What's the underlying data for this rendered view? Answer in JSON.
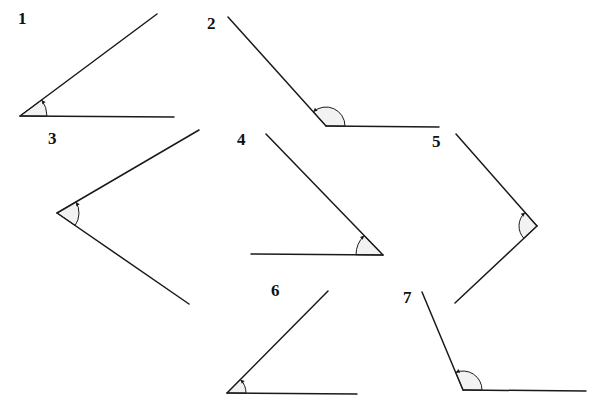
{
  "diagram": {
    "angles": [
      {
        "id": 1,
        "label": "1",
        "type": "acute",
        "label_pos": [
          18,
          10
        ],
        "vertex": [
          20,
          116
        ],
        "ray_a": [
          157,
          14
        ],
        "ray_b": [
          174,
          117
        ],
        "arc_r": 27
      },
      {
        "id": 2,
        "label": "2",
        "type": "obtuse",
        "label_pos": [
          207,
          15
        ],
        "vertex": [
          326,
          126
        ],
        "ray_a": [
          228,
          17
        ],
        "ray_b": [
          439,
          127
        ],
        "arc_r": 19
      },
      {
        "id": 3,
        "label": "3",
        "type": "acute",
        "label_pos": [
          48,
          130
        ],
        "vertex": [
          57,
          213
        ],
        "ray_a": [
          199,
          130
        ],
        "ray_b": [
          189,
          304
        ],
        "arc_r": 22
      },
      {
        "id": 4,
        "label": "4",
        "type": "acute",
        "label_pos": [
          237,
          131
        ],
        "vertex": [
          383,
          255
        ],
        "ray_a": [
          266,
          134
        ],
        "ray_b": [
          251,
          254
        ],
        "arc_r": 27
      },
      {
        "id": 5,
        "label": "5",
        "type": "acute",
        "label_pos": [
          432,
          133
        ],
        "vertex": [
          537,
          226
        ],
        "ray_a": [
          456,
          134
        ],
        "ray_b": [
          455,
          303
        ],
        "arc_r": 18
      },
      {
        "id": 6,
        "label": "6",
        "type": "acute",
        "label_pos": [
          271,
          282
        ],
        "vertex": [
          227,
          393
        ],
        "ray_a": [
          328,
          291
        ],
        "ray_b": [
          357,
          394
        ],
        "arc_r": 19
      },
      {
        "id": 7,
        "label": "7",
        "type": "obtuse",
        "label_pos": [
          403,
          289
        ],
        "vertex": [
          463,
          390
        ],
        "ray_a": [
          422,
          292
        ],
        "ray_b": [
          586,
          391
        ],
        "arc_r": 19
      }
    ]
  }
}
